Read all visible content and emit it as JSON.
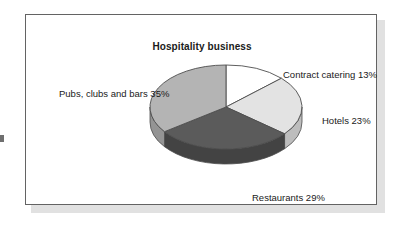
{
  "figure": {
    "title": "Hospitality business"
  },
  "chart_data": {
    "type": "pie",
    "title": "Hospitality business",
    "xlabel": "",
    "ylabel": "",
    "unit": "percent",
    "start_angle_deg": 0,
    "direction": "clockwise",
    "three_d": true,
    "legend": "none",
    "labels_position": "outside",
    "categories": [
      "Contract catering",
      "Hotels",
      "Restaurants",
      "Pubs, clubs and bars"
    ],
    "values": [
      13,
      23,
      29,
      35
    ],
    "total": 100,
    "slices": [
      {
        "name": "Contract catering",
        "value": 13,
        "label": "Contract catering 13%",
        "color": "#ffffff",
        "side_color": "#d8d8d8",
        "start_deg": 0,
        "end_deg": 46.8
      },
      {
        "name": "Hotels",
        "value": 23,
        "label": "Hotels 23%",
        "color": "#e3e3e3",
        "side_color": "#bdbdbd",
        "start_deg": 46.8,
        "end_deg": 129.6
      },
      {
        "name": "Restaurants",
        "value": 29,
        "label": "Restaurants 29%",
        "color": "#5b5b5b",
        "side_color": "#434343",
        "start_deg": 129.6,
        "end_deg": 234.0
      },
      {
        "name": "Pubs, clubs and bars",
        "value": 35,
        "label": "Pubs, clubs and bars 35%",
        "color": "#b4b4b4",
        "side_color": "#949494",
        "start_deg": 234.0,
        "end_deg": 360.0
      }
    ],
    "outline_color": "#4d4d4d"
  },
  "colors": {
    "frame_border": "#636363",
    "frame_shadow": "#c9c9c9",
    "page_background": "#ffffff",
    "text": "#1a1a1a"
  }
}
